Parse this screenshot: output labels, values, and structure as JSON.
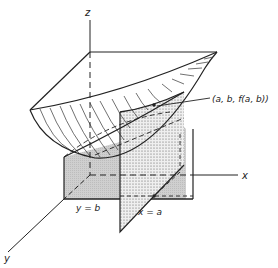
{
  "figure": {
    "labels": {
      "z_axis": "z",
      "x_axis": "x",
      "y_axis": "y",
      "plane_y": "y = b",
      "plane_x": "x = a",
      "point": "(a, b, f(a, b))"
    }
  },
  "colors": {
    "ink": "#222222",
    "plane_fill": "#cfcfcf",
    "dotted_plane_fill": "#e2e2e2",
    "background": "#ffffff"
  }
}
